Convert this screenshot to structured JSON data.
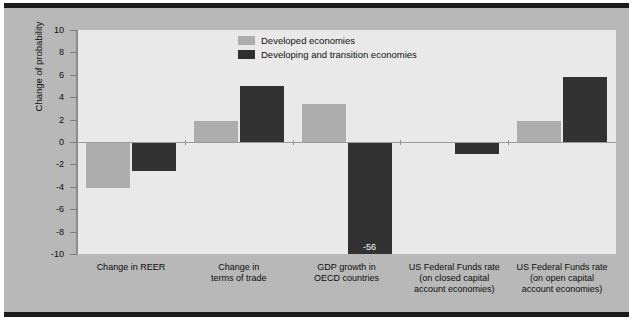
{
  "chart_data": {
    "type": "bar",
    "title": "",
    "xlabel": "",
    "ylabel": "Change of probability",
    "ylim": [
      -10,
      10
    ],
    "yticks": [
      10,
      8,
      6,
      4,
      2,
      0,
      -2,
      -4,
      -6,
      -8,
      -10
    ],
    "grid": false,
    "legend_position": "top-center",
    "categories": [
      "Change in REER",
      "Change in\nterms of trade",
      "GDP growth in\nOECD countries",
      "US Federal Funds rate\n(on closed capital\naccount economies)",
      "US Federal Funds rate\n(on open capital\naccount economies)"
    ],
    "category_lines": [
      [
        "Change in REER"
      ],
      [
        "Change in",
        "terms of trade"
      ],
      [
        "GDP growth in",
        "OECD countries"
      ],
      [
        "US Federal Funds rate",
        "(on closed capital",
        "account economies)"
      ],
      [
        "US Federal Funds rate",
        "(on open capital",
        "account economies)"
      ]
    ],
    "series": [
      {
        "name": "Developed economies",
        "color": "#adadad",
        "values": [
          -4.1,
          1.9,
          3.4,
          null,
          1.9
        ]
      },
      {
        "name": "Developing and transition economies",
        "color": "#323232",
        "values": [
          -2.6,
          5.0,
          -56,
          -1.1,
          5.8
        ]
      }
    ],
    "data_labels": [
      {
        "series": "Developing and transition economies",
        "category": "GDP growth in OECD countries",
        "text": "-56"
      }
    ],
    "annotations": []
  },
  "legend": {
    "items": [
      {
        "label": "Developed economies",
        "swatch": "light"
      },
      {
        "label": "Developing and transition economies",
        "swatch": "dark"
      }
    ]
  },
  "axis": {
    "y_title": "Change of probability",
    "y_tick_labels": [
      "10",
      "8",
      "6",
      "4",
      "2",
      "0",
      "-2",
      "-4",
      "-6",
      "-8",
      "-10"
    ]
  },
  "colors": {
    "light_bar": "#adadad",
    "dark_bar": "#323232",
    "plot_background": "#e9e9e9",
    "figure_background": "#b8b8b8",
    "frame": "#1c1c1c",
    "axis_line": "#8c8c8c",
    "text": "#0d0d0d"
  }
}
